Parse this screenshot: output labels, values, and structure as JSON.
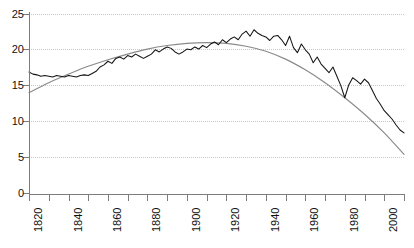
{
  "chart_data": {
    "type": "line",
    "title": "",
    "subtitle": "",
    "xlabel": "",
    "ylabel": "",
    "xlim": [
      1820,
      2010
    ],
    "ylim": [
      0,
      25
    ],
    "grid": true,
    "legend": "none",
    "y_ticks": [
      0,
      5,
      10,
      15,
      20,
      25
    ],
    "y_tick_labels": [
      "0",
      "5",
      "10",
      "15",
      "20",
      "25"
    ],
    "x_ticks": [
      1820,
      1830,
      1840,
      1850,
      1860,
      1870,
      1880,
      1890,
      1900,
      1910,
      1920,
      1930,
      1940,
      1950,
      1960,
      1970,
      1980,
      1990,
      2000,
      2010
    ],
    "x_tick_labels": [
      "1820",
      "",
      "1840",
      "",
      "1860",
      "",
      "1880",
      "",
      "1900",
      "",
      "1920",
      "",
      "1940",
      "",
      "1960",
      "",
      "1980",
      "",
      "2000",
      ""
    ],
    "x_labels_rotated": true,
    "colors": {
      "annual": "#141414",
      "trend": "#8a8a8a",
      "axis": "#7d7d7d",
      "grid": "#c8c8c8",
      "background": "#ffffff"
    },
    "series": [
      {
        "name": "annual",
        "style": "jagged",
        "x": [
          1820,
          1822,
          1824,
          1826,
          1828,
          1830,
          1832,
          1834,
          1836,
          1838,
          1840,
          1842,
          1844,
          1846,
          1848,
          1850,
          1852,
          1854,
          1856,
          1858,
          1860,
          1862,
          1864,
          1866,
          1868,
          1870,
          1872,
          1874,
          1876,
          1878,
          1880,
          1882,
          1884,
          1886,
          1888,
          1890,
          1892,
          1894,
          1896,
          1898,
          1900,
          1902,
          1904,
          1906,
          1908,
          1910,
          1912,
          1914,
          1916,
          1918,
          1920,
          1922,
          1924,
          1926,
          1928,
          1930,
          1932,
          1934,
          1936,
          1938,
          1940,
          1942,
          1944,
          1946,
          1948,
          1950,
          1952,
          1954,
          1956,
          1958,
          1960,
          1962,
          1964,
          1966,
          1968,
          1970,
          1972,
          1974,
          1976,
          1978,
          1980,
          1982,
          1984,
          1986,
          1988,
          1990,
          1992,
          1994,
          1996,
          1998,
          2000,
          2002,
          2004,
          2006,
          2008,
          2010
        ],
        "values": [
          16.9,
          16.6,
          16.5,
          16.3,
          16.4,
          16.3,
          16.2,
          16.4,
          16.3,
          16.2,
          16.4,
          16.3,
          16.2,
          16.4,
          16.5,
          16.4,
          16.7,
          17.0,
          17.6,
          17.9,
          18.4,
          18.1,
          18.8,
          19.0,
          18.7,
          19.2,
          19.0,
          19.4,
          19.1,
          18.8,
          19.1,
          19.4,
          20.0,
          19.7,
          20.1,
          20.4,
          20.2,
          19.7,
          19.4,
          19.7,
          20.1,
          20.0,
          20.4,
          20.1,
          20.6,
          20.3,
          20.8,
          21.1,
          20.7,
          21.4,
          21.0,
          21.5,
          21.8,
          21.4,
          22.2,
          22.6,
          21.9,
          22.8,
          22.3,
          22.0,
          21.8,
          21.3,
          21.9,
          22.0,
          21.4,
          20.6,
          21.9,
          20.3,
          19.6,
          20.8,
          20.0,
          19.4,
          18.2,
          19.0,
          18.0,
          17.4,
          16.8,
          17.6,
          16.3,
          15.0,
          13.3,
          15.1,
          16.1,
          15.7,
          15.2,
          15.9,
          15.4,
          14.3,
          13.2,
          12.4,
          11.5,
          10.9,
          10.3,
          9.5,
          8.8,
          8.4
        ]
      },
      {
        "name": "trend",
        "style": "smooth",
        "x": [
          1820,
          1830,
          1840,
          1850,
          1860,
          1870,
          1880,
          1890,
          1900,
          1910,
          1920,
          1930,
          1940,
          1950,
          1960,
          1970,
          1980,
          1990,
          2000,
          2010
        ],
        "values": [
          14.0,
          15.4,
          16.6,
          17.7,
          18.6,
          19.4,
          20.1,
          20.6,
          20.9,
          21.0,
          20.9,
          20.5,
          19.8,
          18.7,
          17.2,
          15.4,
          13.3,
          11.0,
          8.4,
          5.4
        ]
      }
    ]
  },
  "axis": {
    "y_title": "",
    "x_title": ""
  }
}
